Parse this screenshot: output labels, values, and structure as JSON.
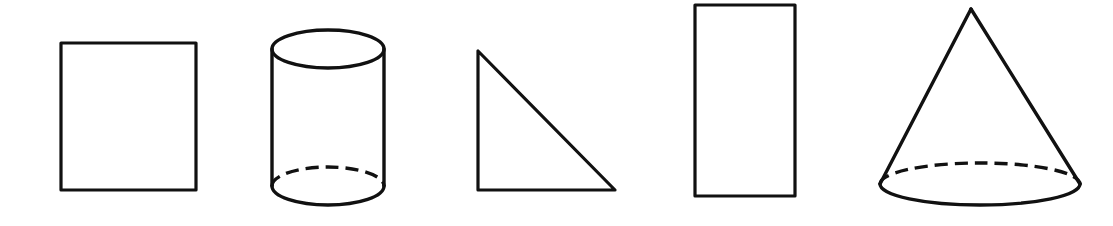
{
  "figure": {
    "background_color": "#ffffff",
    "stroke_color": "#111111",
    "canvas": {
      "width": 1113,
      "height": 226
    },
    "shape_count": 5
  },
  "shapes": [
    {
      "index": 1,
      "name": "square",
      "label": "Square",
      "kind": "2d-polygon",
      "stroke_width": 3.2,
      "geometry": {
        "x": 61,
        "y": 43,
        "width": 135,
        "height": 147
      }
    },
    {
      "index": 2,
      "name": "cylinder",
      "label": "Cylinder",
      "kind": "3d-solid",
      "stroke_width": 3.4,
      "geometry": {
        "center_x": 328,
        "top_ellipse_cy": 49,
        "bottom_ellipse_cy": 186,
        "rx": 56,
        "ry": 19,
        "left_wall_x": 272,
        "right_wall_x": 384,
        "wall_top_y": 49,
        "wall_bottom_y": 186
      },
      "hidden_edge": {
        "style": "dashed",
        "dash_length": 13,
        "gap_length": 7,
        "stroke_width": 3.4,
        "position": "rear-bottom-arc"
      }
    },
    {
      "index": 3,
      "name": "right-triangle",
      "label": "Right triangle",
      "kind": "2d-polygon",
      "stroke_width": 3.2,
      "geometry": {
        "vertices": [
          {
            "x": 478,
            "y": 51
          },
          {
            "x": 478,
            "y": 190
          },
          {
            "x": 615,
            "y": 190
          }
        ],
        "right_angle_at": "bottom-left"
      }
    },
    {
      "index": 4,
      "name": "rectangle",
      "label": "Rectangle",
      "kind": "2d-polygon",
      "stroke_width": 3.2,
      "geometry": {
        "x": 695,
        "y": 5,
        "width": 100,
        "height": 191
      }
    },
    {
      "index": 5,
      "name": "cone",
      "label": "Cone",
      "kind": "3d-solid",
      "stroke_width": 3.4,
      "geometry": {
        "apex_x": 971,
        "apex_y": 9,
        "base_cx": 980,
        "base_cy": 184,
        "rx": 100,
        "ry": 21,
        "left_base_x": 880,
        "right_base_x": 1080
      },
      "hidden_edge": {
        "style": "dashed",
        "dash_length": 13,
        "gap_length": 7,
        "stroke_width": 3.4,
        "position": "rear-base-arc"
      }
    }
  ]
}
